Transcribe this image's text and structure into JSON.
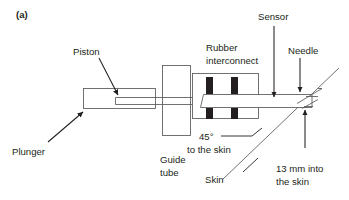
{
  "figure": {
    "panel_label": "(a)",
    "domain_type": "schematic-diagram",
    "background_color": "#ffffff",
    "line_color": "#58595b",
    "text_color": "#231f20",
    "block_fill_color": "#231f20",
    "width": 349,
    "height": 200
  },
  "labels": {
    "piston": "Piston",
    "plunger": "Plunger",
    "guide_tube_line1": "Guide",
    "guide_tube_line2": "tube",
    "rubber_line1": "Rubber",
    "rubber_line2": "interconnect",
    "sensor": "Sensor",
    "needle": "Needle",
    "angle_line1": "45°",
    "angle_line2": "to the skin",
    "skin": "Skin",
    "depth_line1": "13 mm into",
    "depth_line2": "the skin"
  },
  "annotations": {
    "insertion_angle_degrees": 45,
    "insertion_depth_mm": 13,
    "insertion_depth_units": "mm"
  },
  "components": [
    {
      "name": "plunger",
      "shape": "rectangle",
      "label": "Plunger"
    },
    {
      "name": "piston",
      "shape": "inner-tube",
      "label": "Piston"
    },
    {
      "name": "guide-tube",
      "shape": "rectangle",
      "label": "Guide tube"
    },
    {
      "name": "rubber-interconnect",
      "shape": "rectangle-with-blocks",
      "label": "Rubber interconnect"
    },
    {
      "name": "sensor",
      "shape": "arrow-target",
      "label": "Sensor"
    },
    {
      "name": "needle",
      "shape": "tapered-tip",
      "label": "Needle"
    },
    {
      "name": "skin",
      "shape": "diagonal-line",
      "label": "Skin"
    }
  ]
}
